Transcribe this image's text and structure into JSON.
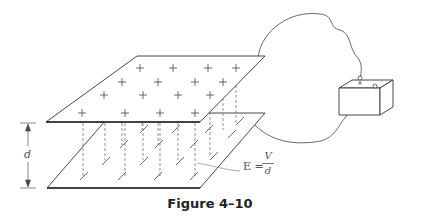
{
  "figure": {
    "caption": "Figure 4–10",
    "dimension_label": "d",
    "equation": {
      "lhs": "E",
      "equals": "=",
      "numerator": "V",
      "denominator": "d"
    },
    "top_plate_charge_symbol": "+",
    "bottom_plate_charge_symbol": "−",
    "elements": [
      "top-plate-positive",
      "bottom-plate-negative",
      "field-lines-dashed",
      "battery",
      "connecting-wires",
      "separation-dimension"
    ],
    "colors": {
      "line": "#333333",
      "dashed": "#666666",
      "label": "#555555"
    }
  }
}
